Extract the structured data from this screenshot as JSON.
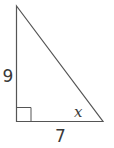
{
  "diagram": {
    "type": "right-triangle",
    "labels": {
      "vertical_leg": "9",
      "horizontal_leg": "7",
      "angle": "x"
    },
    "colors": {
      "stroke": "#555555",
      "text": "#3a3a3a",
      "background": "#ffffff"
    }
  }
}
